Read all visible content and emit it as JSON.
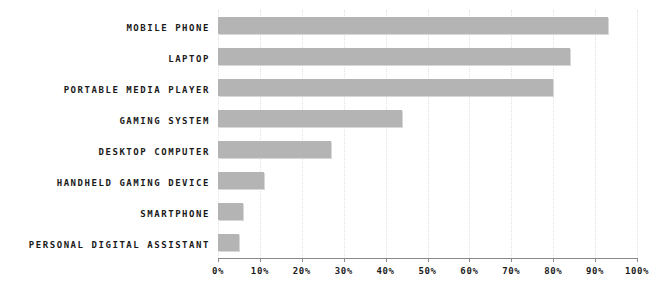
{
  "chart_data": {
    "type": "bar",
    "orientation": "horizontal",
    "title": "",
    "subtitle": "",
    "xlabel": "",
    "ylabel": "",
    "xlim": [
      0,
      100
    ],
    "xticks": [
      0,
      10,
      20,
      30,
      40,
      50,
      60,
      70,
      80,
      90,
      100
    ],
    "xtick_labels": [
      "0%",
      "10%",
      "20%",
      "30%",
      "40%",
      "50%",
      "60%",
      "70%",
      "80%",
      "90%",
      "100%"
    ],
    "grid": "vertical-dotted",
    "legend": null,
    "bar_color": "#b4b4b4",
    "axis_color": "#8a8a8a",
    "grid_color": "#e2e2e2",
    "text_color": "#1a1a1a",
    "categories": [
      "MOBILE PHONE",
      "LAPTOP",
      "PORTABLE MEDIA PLAYER",
      "GAMING SYSTEM",
      "DESKTOP COMPUTER",
      "HANDHELD GAMING DEVICE",
      "SMARTPHONE",
      "PERSONAL DIGITAL ASSISTANT"
    ],
    "values": [
      93,
      84,
      80,
      44,
      27,
      11,
      6,
      5
    ],
    "bars": [
      {
        "label": "MOBILE PHONE",
        "value": 93
      },
      {
        "label": "LAPTOP",
        "value": 84
      },
      {
        "label": "PORTABLE MEDIA PLAYER",
        "value": 80
      },
      {
        "label": "GAMING SYSTEM",
        "value": 44
      },
      {
        "label": "DESKTOP COMPUTER",
        "value": 27
      },
      {
        "label": "HANDHELD GAMING DEVICE",
        "value": 11
      },
      {
        "label": "SMARTPHONE",
        "value": 6
      },
      {
        "label": "PERSONAL DIGITAL ASSISTANT",
        "value": 5
      }
    ]
  }
}
